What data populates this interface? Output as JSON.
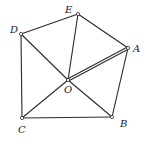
{
  "diagram": {
    "points": [
      {
        "id": "A",
        "x": 128,
        "y": 48,
        "lx": 133,
        "ly": 52
      },
      {
        "id": "B",
        "x": 112,
        "y": 117,
        "lx": 120,
        "ly": 127
      },
      {
        "id": "C",
        "x": 22,
        "y": 118,
        "lx": 18,
        "ly": 133
      },
      {
        "id": "D",
        "x": 21,
        "y": 34,
        "lx": 10,
        "ly": 33
      },
      {
        "id": "E",
        "x": 78,
        "y": 14,
        "lx": 65,
        "ly": 13
      },
      {
        "id": "O",
        "x": 68,
        "y": 80,
        "lx": 64,
        "ly": 93
      }
    ],
    "segments": [
      [
        "D",
        "E"
      ],
      [
        "E",
        "A"
      ],
      [
        "A",
        "B"
      ],
      [
        "B",
        "C"
      ],
      [
        "C",
        "D"
      ],
      [
        "D",
        "O"
      ],
      [
        "O",
        "B"
      ],
      [
        "C",
        "O"
      ],
      [
        "E",
        "O"
      ]
    ],
    "double_segments": [
      [
        "O",
        "A"
      ]
    ]
  }
}
